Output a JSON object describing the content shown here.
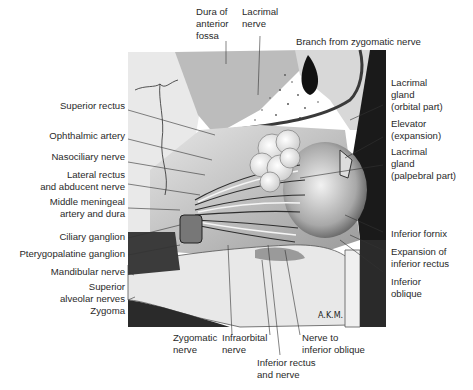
{
  "figure": {
    "signature": "AKM",
    "labels": {
      "top": [
        {
          "id": "dura-anterior-fossa",
          "text": "Dura of\nanterior\nfossa"
        },
        {
          "id": "lacrimal-nerve",
          "text": "Lacrimal\nnerve"
        },
        {
          "id": "branch-zygomatic",
          "text": "Branch from zygomatic nerve"
        }
      ],
      "left": [
        {
          "id": "superior-rectus",
          "text": "Superior rectus"
        },
        {
          "id": "ophthalmic-artery",
          "text": "Ophthalmic artery"
        },
        {
          "id": "nasociliary-nerve",
          "text": "Nasociliary nerve"
        },
        {
          "id": "lateral-rectus",
          "text": "Lateral rectus\nand abducent nerve"
        },
        {
          "id": "middle-meningeal",
          "text": "Middle meningeal\nartery and dura"
        },
        {
          "id": "ciliary-ganglion",
          "text": "Ciliary ganglion"
        },
        {
          "id": "pterygopalatine-ganglion",
          "text": "Pterygopalatine ganglion"
        },
        {
          "id": "mandibular-nerve",
          "text": "Mandibular nerve"
        },
        {
          "id": "superior-alveolar",
          "text": "Superior\nalveolar nerves"
        },
        {
          "id": "zygoma",
          "text": "Zygoma"
        }
      ],
      "right": [
        {
          "id": "lacrimal-gland-orbital",
          "text": "Lacrimal\ngland\n(orbital part)"
        },
        {
          "id": "elevator-expansion",
          "text": "Elevator\n(expansion)"
        },
        {
          "id": "lacrimal-gland-palpebral",
          "text": "Lacrimal\ngland\n(palpebral part)"
        },
        {
          "id": "inferior-fornix",
          "text": "Inferior fornix"
        },
        {
          "id": "expansion-inferior-rectus",
          "text": "Expansion of\ninferior rectus"
        },
        {
          "id": "inferior-oblique",
          "text": "Inferior\noblique"
        }
      ],
      "bottom": [
        {
          "id": "zygomatic-nerve",
          "text": "Zygomatic\nnerve"
        },
        {
          "id": "infraorbital-nerve",
          "text": "Infraorbital\nnerve"
        },
        {
          "id": "nerve-inferior-oblique",
          "text": "Nerve to\ninferior oblique"
        },
        {
          "id": "inferior-rectus-nerve",
          "text": "Inferior rectus\nand nerve"
        }
      ]
    }
  }
}
